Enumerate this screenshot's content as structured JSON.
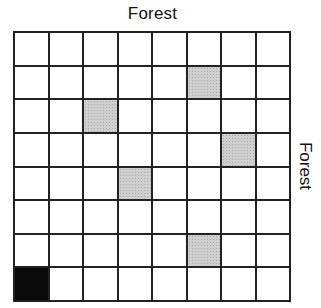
{
  "labels": {
    "top": "Forest",
    "right": "Forest"
  },
  "grid": {
    "rows": 8,
    "cols": 8,
    "cells": [
      [
        "white",
        "white",
        "white",
        "white",
        "white",
        "white",
        "white",
        "white"
      ],
      [
        "white",
        "white",
        "white",
        "white",
        "white",
        "gray",
        "white",
        "white"
      ],
      [
        "white",
        "white",
        "gray",
        "white",
        "white",
        "white",
        "white",
        "white"
      ],
      [
        "white",
        "white",
        "white",
        "white",
        "white",
        "white",
        "gray",
        "white"
      ],
      [
        "white",
        "white",
        "white",
        "gray",
        "white",
        "white",
        "white",
        "white"
      ],
      [
        "white",
        "white",
        "white",
        "white",
        "white",
        "white",
        "white",
        "white"
      ],
      [
        "white",
        "white",
        "white",
        "white",
        "white",
        "gray",
        "white",
        "white"
      ],
      [
        "black",
        "white",
        "white",
        "white",
        "white",
        "white",
        "white",
        "white"
      ]
    ]
  },
  "colors": {
    "gray": "#cfcfcf",
    "black": "#0a0a0a",
    "line": "#222222"
  }
}
